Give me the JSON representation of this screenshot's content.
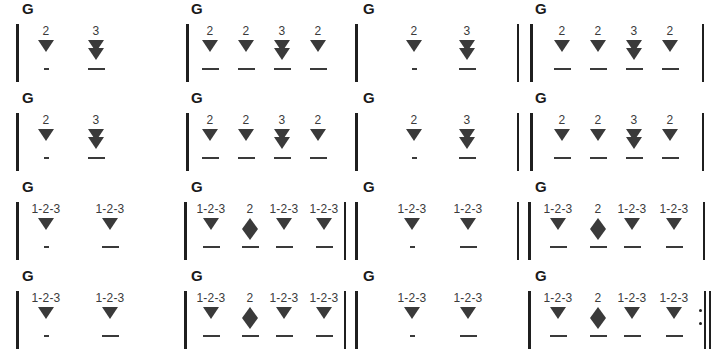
{
  "document": {
    "title": "Guitar Strumming Pattern Chart",
    "chord_label": "G",
    "colors": {
      "ink": "#2b2b2b",
      "glyph": "#3a3a3a",
      "barline": "#1f1f1f",
      "background": "#ffffff"
    },
    "glyph_names": {
      "down": "downstroke-arrow-icon",
      "double_down": "double-downstroke-arrow-icon",
      "up_down": "up-down-stroke-arrow-icon"
    }
  },
  "rows": [
    {
      "id": "row-1",
      "top": 0,
      "measures": [
        {
          "id": "r1m1",
          "left": 0,
          "width": 178,
          "chord": "G",
          "chord_x": 22,
          "barline_x": 16,
          "end_barline_x": null,
          "repeat": false,
          "beats": [
            {
              "count": "2",
              "x": 46,
              "stroke": "down",
              "underline": "short"
            },
            {
              "count": "3",
              "x": 96,
              "stroke": "double-down",
              "underline": "long"
            }
          ]
        },
        {
          "id": "r1m2",
          "left": 178,
          "width": 172,
          "chord": "G",
          "chord_x": 13,
          "barline_x": 8,
          "end_barline_x": null,
          "repeat": false,
          "beats": [
            {
              "count": "2",
              "x": 32,
              "stroke": "down",
              "underline": "long"
            },
            {
              "count": "2",
              "x": 68,
              "stroke": "down",
              "underline": "long"
            },
            {
              "count": "3",
              "x": 104,
              "stroke": "double-down",
              "underline": "long"
            },
            {
              "count": "2",
              "x": 140,
              "stroke": "down",
              "underline": "long"
            }
          ]
        },
        {
          "id": "r1m3",
          "left": 350,
          "width": 172,
          "chord": "G",
          "chord_x": 13,
          "barline_x": 5,
          "end_barline_x": 167,
          "repeat": false,
          "beats": [
            {
              "count": "2",
              "x": 64,
              "stroke": "down",
              "underline": "short"
            },
            {
              "count": "3",
              "x": 117,
              "stroke": "double-down",
              "underline": "long"
            }
          ]
        },
        {
          "id": "r1m4",
          "left": 522,
          "width": 189,
          "chord": "G",
          "chord_x": 13,
          "barline_x": 8,
          "end_barline_x": 180,
          "repeat": false,
          "beats": [
            {
              "count": "2",
              "x": 40,
              "stroke": "down",
              "underline": "long"
            },
            {
              "count": "2",
              "x": 76,
              "stroke": "down",
              "underline": "long"
            },
            {
              "count": "3",
              "x": 112,
              "stroke": "double-down",
              "underline": "long"
            },
            {
              "count": "2",
              "x": 148,
              "stroke": "down",
              "underline": "long"
            }
          ]
        }
      ]
    },
    {
      "id": "row-2",
      "top": 89,
      "measures": [
        {
          "id": "r2m1",
          "left": 0,
          "width": 178,
          "chord": "G",
          "chord_x": 22,
          "barline_x": 16,
          "end_barline_x": null,
          "repeat": false,
          "beats": [
            {
              "count": "2",
              "x": 46,
              "stroke": "down",
              "underline": "short"
            },
            {
              "count": "3",
              "x": 96,
              "stroke": "double-down",
              "underline": "long"
            }
          ]
        },
        {
          "id": "r2m2",
          "left": 178,
          "width": 172,
          "chord": "G",
          "chord_x": 13,
          "barline_x": 8,
          "end_barline_x": null,
          "repeat": false,
          "beats": [
            {
              "count": "2",
              "x": 32,
              "stroke": "down",
              "underline": "long"
            },
            {
              "count": "2",
              "x": 68,
              "stroke": "down",
              "underline": "long"
            },
            {
              "count": "3",
              "x": 104,
              "stroke": "double-down",
              "underline": "long"
            },
            {
              "count": "2",
              "x": 140,
              "stroke": "down",
              "underline": "long"
            }
          ]
        },
        {
          "id": "r2m3",
          "left": 350,
          "width": 172,
          "chord": "G",
          "chord_x": 13,
          "barline_x": 5,
          "end_barline_x": 167,
          "repeat": false,
          "beats": [
            {
              "count": "2",
              "x": 64,
              "stroke": "down",
              "underline": "short"
            },
            {
              "count": "3",
              "x": 117,
              "stroke": "double-down",
              "underline": "long"
            }
          ]
        },
        {
          "id": "r2m4",
          "left": 522,
          "width": 189,
          "chord": "G",
          "chord_x": 13,
          "barline_x": 8,
          "end_barline_x": 180,
          "repeat": false,
          "beats": [
            {
              "count": "2",
              "x": 40,
              "stroke": "down",
              "underline": "long"
            },
            {
              "count": "2",
              "x": 76,
              "stroke": "down",
              "underline": "long"
            },
            {
              "count": "3",
              "x": 112,
              "stroke": "double-down",
              "underline": "long"
            },
            {
              "count": "2",
              "x": 148,
              "stroke": "down",
              "underline": "long"
            }
          ]
        }
      ]
    },
    {
      "id": "row-3",
      "top": 178,
      "measures": [
        {
          "id": "r3m1",
          "left": 0,
          "width": 178,
          "chord": "G",
          "chord_x": 22,
          "barline_x": 16,
          "end_barline_x": null,
          "repeat": false,
          "beats": [
            {
              "count": "1-2-3",
              "x": 46,
              "stroke": "down",
              "underline": "short"
            },
            {
              "count": "1-2-3",
              "x": 110,
              "stroke": "down",
              "underline": "long"
            }
          ]
        },
        {
          "id": "r3m2",
          "left": 178,
          "width": 172,
          "chord": "G",
          "chord_x": 13,
          "barline_x": 6,
          "end_barline_x": 166,
          "repeat": false,
          "beats": [
            {
              "count": "1-2-3",
              "x": 33,
              "stroke": "down",
              "underline": "long"
            },
            {
              "count": "2",
              "x": 72,
              "stroke": "up-down",
              "underline": "long"
            },
            {
              "count": "1-2-3",
              "x": 106,
              "stroke": "down",
              "underline": "long"
            },
            {
              "count": "1-2-3",
              "x": 146,
              "stroke": "down",
              "underline": "long"
            }
          ]
        },
        {
          "id": "r3m3",
          "left": 350,
          "width": 172,
          "chord": "G",
          "chord_x": 13,
          "barline_x": 5,
          "end_barline_x": 167,
          "repeat": false,
          "beats": [
            {
              "count": "1-2-3",
              "x": 62,
              "stroke": "down",
              "underline": "short"
            },
            {
              "count": "1-2-3",
              "x": 118,
              "stroke": "down",
              "underline": "long"
            }
          ]
        },
        {
          "id": "r3m4",
          "left": 522,
          "width": 189,
          "chord": "G",
          "chord_x": 13,
          "barline_x": 6,
          "end_barline_x": 181,
          "repeat": false,
          "beats": [
            {
              "count": "1-2-3",
              "x": 36,
              "stroke": "down",
              "underline": "long"
            },
            {
              "count": "2",
              "x": 76,
              "stroke": "up-down",
              "underline": "long"
            },
            {
              "count": "1-2-3",
              "x": 110,
              "stroke": "down",
              "underline": "long"
            },
            {
              "count": "1-2-3",
              "x": 152,
              "stroke": "down",
              "underline": "long"
            }
          ]
        }
      ]
    },
    {
      "id": "row-4",
      "top": 267,
      "measures": [
        {
          "id": "r4m1",
          "left": 0,
          "width": 178,
          "chord": "G",
          "chord_x": 22,
          "barline_x": 16,
          "end_barline_x": null,
          "repeat": false,
          "beats": [
            {
              "count": "1-2-3",
              "x": 46,
              "stroke": "down",
              "underline": "short"
            },
            {
              "count": "1-2-3",
              "x": 110,
              "stroke": "down",
              "underline": "long"
            }
          ]
        },
        {
          "id": "r4m2",
          "left": 178,
          "width": 172,
          "chord": "G",
          "chord_x": 13,
          "barline_x": 6,
          "end_barline_x": 166,
          "repeat": false,
          "beats": [
            {
              "count": "1-2-3",
              "x": 33,
              "stroke": "down",
              "underline": "long"
            },
            {
              "count": "2",
              "x": 72,
              "stroke": "up-down",
              "underline": "long"
            },
            {
              "count": "1-2-3",
              "x": 106,
              "stroke": "down",
              "underline": "long"
            },
            {
              "count": "1-2-3",
              "x": 146,
              "stroke": "down",
              "underline": "long"
            }
          ]
        },
        {
          "id": "r4m3",
          "left": 350,
          "width": 172,
          "chord": "G",
          "chord_x": 13,
          "barline_x": 5,
          "end_barline_x": null,
          "repeat": false,
          "beats": [
            {
              "count": "1-2-3",
              "x": 62,
              "stroke": "down",
              "underline": "short"
            },
            {
              "count": "1-2-3",
              "x": 118,
              "stroke": "down",
              "underline": "long"
            }
          ]
        },
        {
          "id": "r4m4",
          "left": 522,
          "width": 189,
          "chord": "G",
          "chord_x": 13,
          "barline_x": 6,
          "end_barline_x": null,
          "repeat": true,
          "repeat_x": 177,
          "beats": [
            {
              "count": "1-2-3",
              "x": 36,
              "stroke": "down",
              "underline": "long"
            },
            {
              "count": "2",
              "x": 76,
              "stroke": "up-down",
              "underline": "long"
            },
            {
              "count": "1-2-3",
              "x": 110,
              "stroke": "down",
              "underline": "long"
            },
            {
              "count": "1-2-3",
              "x": 152,
              "stroke": "down",
              "underline": "long"
            }
          ]
        }
      ]
    }
  ]
}
